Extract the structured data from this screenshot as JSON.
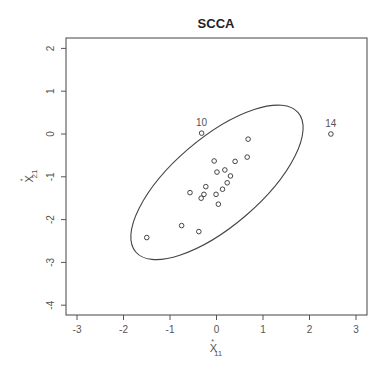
{
  "chart_data": {
    "type": "scatter",
    "title": "SCCA",
    "xlabel": "X*11",
    "ylabel": "X*21",
    "xlabel_parts": {
      "base": "X",
      "sup": "*",
      "sub": "11"
    },
    "ylabel_parts": {
      "base": "X",
      "sup": "*",
      "sub": "21"
    },
    "xlim": [
      -3.2,
      3.25
    ],
    "ylim": [
      -4.2,
      2.25
    ],
    "x_ticks": [
      -3,
      -2,
      -1,
      0,
      1,
      2,
      3
    ],
    "y_ticks": [
      -4,
      -3,
      -2,
      -1,
      0,
      1,
      2
    ],
    "grid": false,
    "legend": null,
    "points": [
      {
        "x": -0.32,
        "y": 0.02,
        "label": "10"
      },
      {
        "x": 0.68,
        "y": -0.12,
        "label": ""
      },
      {
        "x": -0.05,
        "y": -0.63,
        "label": ""
      },
      {
        "x": 0.4,
        "y": -0.64,
        "label": ""
      },
      {
        "x": 0.66,
        "y": -0.54,
        "label": ""
      },
      {
        "x": 0.01,
        "y": -0.89,
        "label": ""
      },
      {
        "x": 0.18,
        "y": -0.84,
        "label": ""
      },
      {
        "x": 0.3,
        "y": -0.98,
        "label": ""
      },
      {
        "x": 0.23,
        "y": -1.14,
        "label": ""
      },
      {
        "x": -0.23,
        "y": -1.23,
        "label": ""
      },
      {
        "x": 0.13,
        "y": -1.29,
        "label": ""
      },
      {
        "x": -0.57,
        "y": -1.37,
        "label": ""
      },
      {
        "x": -0.27,
        "y": -1.41,
        "label": ""
      },
      {
        "x": -0.33,
        "y": -1.5,
        "label": ""
      },
      {
        "x": -0.01,
        "y": -1.41,
        "label": ""
      },
      {
        "x": 0.04,
        "y": -1.64,
        "label": ""
      },
      {
        "x": -0.75,
        "y": -2.14,
        "label": ""
      },
      {
        "x": -0.38,
        "y": -2.28,
        "label": ""
      },
      {
        "x": -1.5,
        "y": -2.42,
        "label": ""
      },
      {
        "x": 2.46,
        "y": 0.0,
        "label": "14"
      }
    ],
    "ellipse": {
      "center": {
        "x": 0.01,
        "y": -1.13
      },
      "semi_major_px": 107,
      "semi_minor_px": 44,
      "rotation_deg": -40.6
    }
  }
}
